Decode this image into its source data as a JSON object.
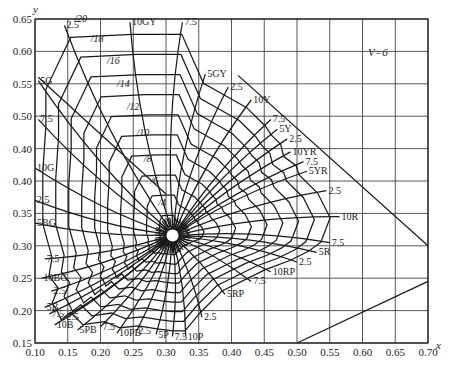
{
  "chart_data": {
    "type": "line",
    "title": "",
    "subtitle": "",
    "annotation": "V=6",
    "xlabel": "x",
    "ylabel": "y",
    "xlim": [
      0.1,
      0.7
    ],
    "ylim": [
      0.15,
      0.65
    ],
    "grid": true,
    "legend": "none",
    "x_ticks": [
      "0.10",
      "0.15",
      "0.20",
      "0.25",
      "0.30",
      "0.35",
      "0.40",
      "0.45",
      "0.50",
      "0.55",
      "0.60",
      "0.65",
      "0.70"
    ],
    "y_ticks": [
      "0.65",
      "0.60",
      "0.55",
      "0.50",
      "0.40",
      "0.40",
      "0.35",
      "0.30",
      "0.25",
      "0.20",
      "0.15"
    ],
    "white_point": {
      "x": 0.31,
      "y": 0.316
    },
    "chroma_labels": [
      "/2",
      "/4",
      "/6",
      "/8",
      "/10",
      "/12",
      "/14",
      "/16",
      "/18",
      "/20"
    ],
    "hue_labels": [
      {
        "label": "2.5",
        "x": 0.145,
        "y": 0.64
      },
      {
        "label": "10GY",
        "x": 0.245,
        "y": 0.645
      },
      {
        "label": "7.5",
        "x": 0.325,
        "y": 0.645
      },
      {
        "label": "5GY",
        "x": 0.36,
        "y": 0.565
      },
      {
        "label": "2.5",
        "x": 0.395,
        "y": 0.545
      },
      {
        "label": "10Y",
        "x": 0.43,
        "y": 0.525
      },
      {
        "label": "7.5",
        "x": 0.46,
        "y": 0.495
      },
      {
        "label": "5Y",
        "x": 0.47,
        "y": 0.48
      },
      {
        "label": "2.5",
        "x": 0.485,
        "y": 0.465
      },
      {
        "label": "10YR",
        "x": 0.49,
        "y": 0.445
      },
      {
        "label": "7.5",
        "x": 0.51,
        "y": 0.43
      },
      {
        "label": "5YR",
        "x": 0.515,
        "y": 0.415
      },
      {
        "label": "2.5",
        "x": 0.545,
        "y": 0.385
      },
      {
        "label": "10R",
        "x": 0.565,
        "y": 0.345
      },
      {
        "label": "7.5",
        "x": 0.55,
        "y": 0.305
      },
      {
        "label": "5R",
        "x": 0.53,
        "y": 0.29
      },
      {
        "label": "2.5",
        "x": 0.5,
        "y": 0.275
      },
      {
        "label": "10RP",
        "x": 0.46,
        "y": 0.26
      },
      {
        "label": "7.5",
        "x": 0.43,
        "y": 0.245
      },
      {
        "label": "5RP",
        "x": 0.39,
        "y": 0.225
      },
      {
        "label": "2.5",
        "x": 0.355,
        "y": 0.19
      },
      {
        "label": "10P",
        "x": 0.33,
        "y": 0.16
      },
      {
        "label": "7.5",
        "x": 0.31,
        "y": 0.16
      },
      {
        "label": "5P",
        "x": 0.285,
        "y": 0.163
      },
      {
        "label": "2.5",
        "x": 0.255,
        "y": 0.168
      },
      {
        "label": "10PB",
        "x": 0.225,
        "y": 0.165
      },
      {
        "label": "7.5",
        "x": 0.2,
        "y": 0.175
      },
      {
        "label": "5PB",
        "x": 0.165,
        "y": 0.17
      },
      {
        "label": "2.5",
        "x": 0.145,
        "y": 0.19
      },
      {
        "label": "10B",
        "x": 0.13,
        "y": 0.178
      },
      {
        "label": "7.5",
        "x": 0.122,
        "y": 0.195
      },
      {
        "label": "5B",
        "x": 0.115,
        "y": 0.205
      },
      {
        "label": "2.5",
        "x": 0.125,
        "y": 0.23
      },
      {
        "label": "10BG",
        "x": 0.11,
        "y": 0.25
      },
      {
        "label": "7.5",
        "x": 0.115,
        "y": 0.28
      },
      {
        "label": "5BG",
        "x": 0.1,
        "y": 0.335
      },
      {
        "label": "2.5",
        "x": 0.1,
        "y": 0.37
      },
      {
        "label": "10G",
        "x": 0.1,
        "y": 0.42
      },
      {
        "label": "7.5",
        "x": 0.105,
        "y": 0.495
      },
      {
        "label": "5G",
        "x": 0.105,
        "y": 0.555
      }
    ]
  },
  "axes": {
    "x_name": "x",
    "y_name": "y",
    "x_ticks": [
      "0.10",
      "0.15",
      "0.20",
      "0.25",
      "0.30",
      "0.35",
      "0.40",
      "0.45",
      "0.50",
      "0.55",
      "0.60",
      "0.65",
      "0.70"
    ],
    "y_ticks": [
      "0.65",
      "0.60",
      "0.55",
      "0.50",
      "0.40",
      "0.40",
      "0.35",
      "0.30",
      "0.25",
      "0.20",
      "0.15"
    ]
  },
  "annotation": "V=6"
}
